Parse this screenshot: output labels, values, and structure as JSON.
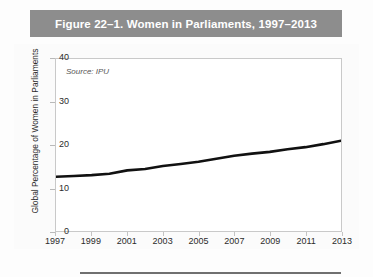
{
  "figure": {
    "title": "Figure 22–1. Women in Parliaments, 1997–2013",
    "source_note": "Source: IPU",
    "title_band_color": "#8d8d8d",
    "line_color": "#111111",
    "panel_background": "#ffffff"
  },
  "chart_data": {
    "type": "line",
    "title": "Figure 22–1. Women in Parliaments, 1997–2013",
    "xlabel": "",
    "ylabel": "Global Percentage of Women in Parliaments",
    "annotation": "Source: IPU",
    "grid": false,
    "legend": "none",
    "xlim": [
      1997,
      2013
    ],
    "ylim": [
      0,
      40
    ],
    "y_ticks": [
      0,
      10,
      20,
      30,
      40
    ],
    "y_tick_labels": [
      "0",
      "10",
      "20",
      "30",
      "40"
    ],
    "x_ticks": [
      1997,
      1999,
      2001,
      2003,
      2005,
      2007,
      2009,
      2011,
      2013
    ],
    "x_tick_labels": [
      "1997",
      "1999",
      "2001",
      "2003",
      "2005",
      "2007",
      "2009",
      "2011",
      "2013"
    ],
    "x": [
      1997,
      1998,
      1999,
      2000,
      2001,
      2002,
      2003,
      2004,
      2005,
      2006,
      2007,
      2008,
      2009,
      2010,
      2011,
      2012,
      2013
    ],
    "values": [
      12.6,
      12.8,
      13.0,
      13.3,
      14.1,
      14.4,
      15.1,
      15.6,
      16.1,
      16.8,
      17.5,
      18.0,
      18.4,
      19.0,
      19.5,
      20.2,
      21.0
    ],
    "series": [
      {
        "name": "Global Percentage of Women in Parliaments",
        "values": [
          12.6,
          12.8,
          13.0,
          13.3,
          14.1,
          14.4,
          15.1,
          15.6,
          16.1,
          16.8,
          17.5,
          18.0,
          18.4,
          19.0,
          19.5,
          20.2,
          21.0
        ]
      }
    ]
  }
}
